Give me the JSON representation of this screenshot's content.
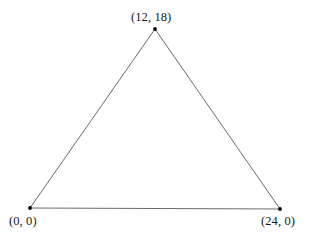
{
  "figure": {
    "title": "",
    "background_color": "#ffffff",
    "edge_color": "#6b6b6b",
    "vertex_color": "#000000",
    "label_color": "#1a1a1a"
  },
  "labels": {
    "apex": "(12, 18)",
    "origin": "(0, 0)",
    "right": "(24, 0)"
  },
  "chart_data": {
    "type": "scatter",
    "title": "",
    "xlabel": "",
    "ylabel": "",
    "grid": false,
    "legend": false,
    "axes_visible": false,
    "shape": "triangle",
    "xlim": [
      0,
      24
    ],
    "ylim": [
      0,
      18
    ],
    "points": [
      {
        "label": "(0, 0)",
        "x": 0,
        "y": 0,
        "px": 30,
        "py": 208
      },
      {
        "label": "(24, 0)",
        "x": 24,
        "y": 0,
        "px": 280,
        "py": 209
      },
      {
        "label": "(12, 18)",
        "x": 12,
        "y": 18,
        "px": 155,
        "py": 29
      }
    ],
    "edges": [
      {
        "name": "left-edge",
        "from": "(0, 0)",
        "to": "(12, 18)"
      },
      {
        "name": "right-edge",
        "from": "(12, 18)",
        "to": "(24, 0)"
      },
      {
        "name": "base-edge",
        "from": "(0, 0)",
        "to": "(24, 0)"
      }
    ]
  }
}
